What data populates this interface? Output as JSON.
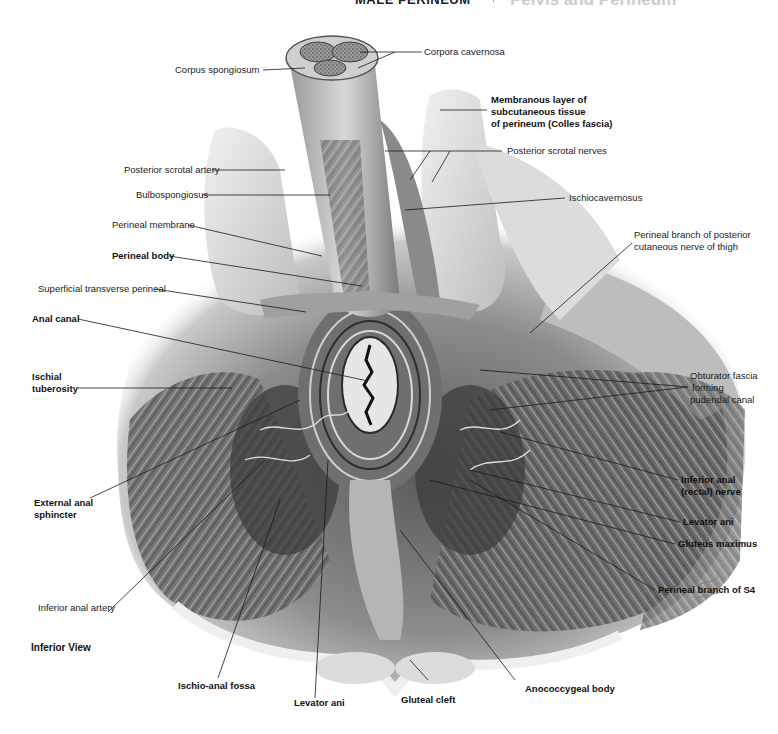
{
  "header": {
    "section": "MALE PERINEUM",
    "chapter_title": "Pelvis and Perineum",
    "page_number": "367"
  },
  "figure": {
    "view_caption": "Inferior View",
    "labels_left": [
      {
        "id": "corpus-spongiosum",
        "text": "Corpus spongiosum",
        "bold": false
      },
      {
        "id": "posterior-scrotal-artery",
        "text": "Posterior scrotal artery",
        "bold": false
      },
      {
        "id": "bulbospongiosus",
        "text": "Bulbospongiosus",
        "bold": false
      },
      {
        "id": "perineal-membrane",
        "text": "Perineal membrane",
        "bold": false
      },
      {
        "id": "perineal-body",
        "text": "Perineal body",
        "bold": true
      },
      {
        "id": "superficial-transverse-perineal",
        "text": "Superficial transverse perineal",
        "bold": false
      },
      {
        "id": "anal-canal",
        "text": "Anal canal",
        "bold": true
      },
      {
        "id": "ischial-tuberosity",
        "text": "Ischial\ntuberosity",
        "line1": "Ischial",
        "line2": "tuberosity",
        "bold": true
      },
      {
        "id": "external-anal-sphincter",
        "text": "External anal\nsphincter",
        "line1": "External anal",
        "line2": "sphincter",
        "bold": true
      },
      {
        "id": "inferior-anal-artery",
        "text": "Inferior anal artery",
        "bold": false
      }
    ],
    "labels_right": [
      {
        "id": "corpora-cavernosa",
        "text": "Corpora cavernosa",
        "bold": false
      },
      {
        "id": "colles-fascia",
        "line1": "Membranous layer of",
        "line2": "subcutaneous tissue",
        "line3": "of perineum (Colles fascia)",
        "bold": true
      },
      {
        "id": "posterior-scrotal-nerves",
        "text": "Posterior scrotal nerves",
        "bold": false
      },
      {
        "id": "ischiocavernosus",
        "text": "Ischiocavernosus",
        "bold": false
      },
      {
        "id": "perineal-branch-posterior-cutaneous",
        "line1": "Perineal branch of posterior",
        "line2": "cutaneous nerve of thigh",
        "bold": false
      },
      {
        "id": "obturator-fascia",
        "line1": "Obturator fascia",
        "line2": "forming",
        "line3": "pudendal canal",
        "bold": false
      },
      {
        "id": "inferior-anal-nerve",
        "line1": "Inferior anal",
        "line2": "(rectal) nerve",
        "bold": true
      },
      {
        "id": "levator-ani-right",
        "text": "Levator ani",
        "bold": true
      },
      {
        "id": "gluteus-maximus",
        "text": "Gluteus maximus",
        "bold": true
      },
      {
        "id": "perineal-branch-s4",
        "text": "Perineal branch of S4",
        "bold": true
      }
    ],
    "labels_bottom": [
      {
        "id": "ischio-anal-fossa",
        "text": "Ischio-anal fossa",
        "bold": true
      },
      {
        "id": "levator-ani-bottom",
        "text": "Levator ani",
        "bold": true
      },
      {
        "id": "gluteal-cleft",
        "text": "Gluteal cleft",
        "bold": true
      },
      {
        "id": "anococcygeal-body",
        "text": "Anococcygeal body",
        "bold": true
      }
    ],
    "colors": {
      "ink": "#1a1a1a",
      "shade_dark": "#4a4a4a",
      "shade_mid": "#8a8a8a",
      "shade_light": "#c8c8c8",
      "paper": "#ffffff"
    }
  }
}
